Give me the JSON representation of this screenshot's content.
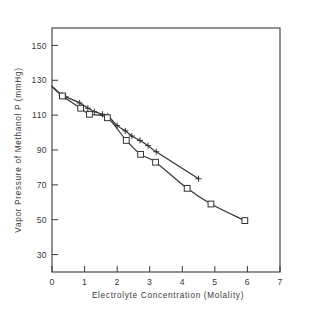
{
  "figure": {
    "background": "#ffffff",
    "ink_color": "#3a3a3a",
    "title": ""
  },
  "chart_data": {
    "type": "line",
    "title": "",
    "subtitle": "",
    "xlabel": "Electrolyte Concentration  (Molality)",
    "ylabel": "Vapor Pressure of Methanol  P (mmHg)",
    "xlim": [
      0,
      7
    ],
    "ylim": [
      20,
      160
    ],
    "xticks": [
      0,
      1,
      2,
      3,
      4,
      5,
      6,
      7
    ],
    "xticklabels": [
      "0",
      "1",
      "2",
      "3",
      "4",
      "5",
      "6",
      "7"
    ],
    "yticks": [
      30,
      50,
      70,
      90,
      110,
      130,
      150
    ],
    "yticklabels": [
      "30",
      "50",
      "70",
      "90",
      "110",
      "130",
      "150"
    ],
    "grid": false,
    "legend": "none",
    "frame": "box",
    "series": [
      {
        "name": "upper-curve-plus",
        "marker": "plus",
        "linestyle": "solid",
        "color": "#333333",
        "x": [
          0.0,
          0.3,
          0.42,
          0.85,
          1.1,
          1.3,
          1.55,
          1.72,
          2.0,
          2.25,
          2.45,
          2.7,
          2.95,
          3.2,
          4.5
        ],
        "y": [
          126.5,
          121.5,
          120.5,
          117.0,
          114.0,
          112.0,
          110.5,
          109.5,
          104.0,
          101.0,
          98.0,
          95.5,
          92.5,
          89.0,
          73.5
        ]
      },
      {
        "name": "lower-curve-square",
        "marker": "square",
        "linestyle": "solid",
        "color": "#333333",
        "x": [
          0.0,
          0.32,
          0.88,
          1.15,
          1.7,
          2.28,
          2.72,
          3.18,
          4.15,
          4.88,
          5.92
        ],
        "y": [
          126.5,
          121.0,
          114.0,
          110.5,
          108.5,
          95.5,
          87.5,
          83.0,
          68.0,
          59.0,
          49.5
        ]
      }
    ],
    "annotations": []
  }
}
